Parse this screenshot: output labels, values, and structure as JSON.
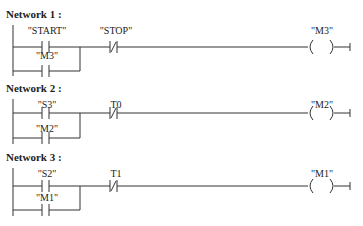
{
  "networks": [
    {
      "title": "Network 1 :",
      "contact_main": "\"START\"",
      "contact_branch": "\"M3\"",
      "contact_nc": "\"STOP\"",
      "coil": "\"M3\""
    },
    {
      "title": "Network 2 :",
      "contact_main": "\"S3\"",
      "contact_branch": "\"M2\"",
      "contact_nc": "T0",
      "coil": "\"M2\""
    },
    {
      "title": "Network 3 :",
      "contact_main": "\"S2\"",
      "contact_branch": "\"M1\"",
      "contact_nc": "T1",
      "coil": "\"M1\""
    }
  ]
}
